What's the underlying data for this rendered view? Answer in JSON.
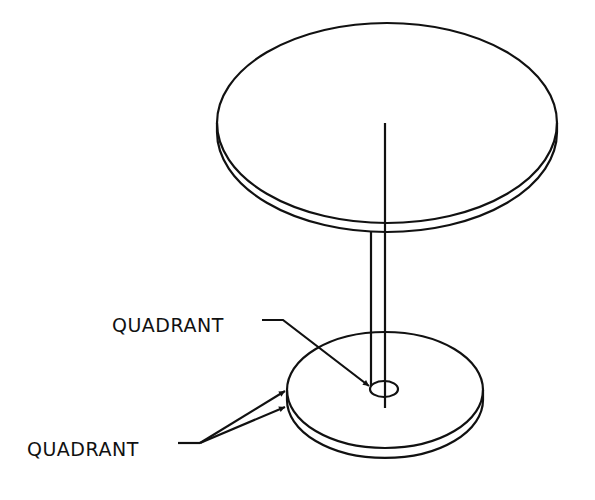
{
  "diagram": {
    "type": "isometric technical drawing",
    "labels": [
      {
        "id": "label-top",
        "text": "QUADRANT",
        "points_to": "hole in lower disc"
      },
      {
        "id": "label-bottom",
        "text": "QUADRANT",
        "points_to": "left edge of lower disc (two arrows)"
      }
    ],
    "colors": {
      "line": "#111111",
      "background": "#ffffff"
    }
  }
}
